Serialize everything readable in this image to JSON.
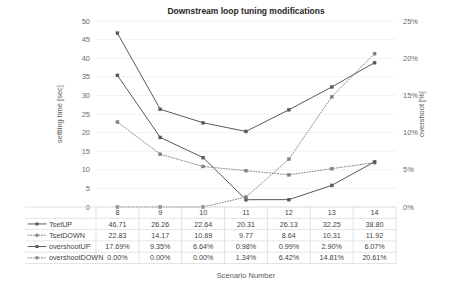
{
  "chart_data": {
    "type": "line",
    "title": "Downstream loop tuning modifications",
    "xlabel": "Scenario Number",
    "ylabel": "settling time [sec]",
    "y2label": "overshoot [%]",
    "categories": [
      "8",
      "9",
      "10",
      "11",
      "12",
      "13",
      "14"
    ],
    "ylim": [
      0,
      50
    ],
    "yticks": [
      "0",
      "5",
      "10",
      "15",
      "20",
      "25",
      "30",
      "35",
      "40",
      "45",
      "50"
    ],
    "y2lim": [
      0,
      25
    ],
    "y2ticks": [
      "0%",
      "5%",
      "10%",
      "15%",
      "20%",
      "25%"
    ],
    "grid": true,
    "legend_position": "bottom-left-table",
    "series": [
      {
        "name": "TsetUP",
        "axis": "left",
        "style": "solid",
        "marker": "square",
        "values": [
          46.71,
          26.26,
          22.64,
          20.31,
          26.13,
          32.25,
          38.8
        ],
        "labels": [
          "46.71",
          "26.26",
          "22.64",
          "20.31",
          "26.13",
          "32.25",
          "38.80"
        ]
      },
      {
        "name": "TsetDOWN",
        "axis": "left",
        "style": "dotted",
        "marker": "square",
        "values": [
          22.83,
          14.17,
          10.89,
          9.77,
          8.64,
          10.31,
          11.92
        ],
        "labels": [
          "22.83",
          "14.17",
          "10.89",
          "9.77",
          "8.64",
          "10.31",
          "11.92"
        ]
      },
      {
        "name": "overshootUP",
        "axis": "right",
        "style": "solid",
        "marker": "square",
        "values": [
          17.69,
          9.35,
          6.64,
          0.98,
          0.99,
          2.9,
          6.07
        ],
        "labels": [
          "17.69%",
          "9.35%",
          "6.64%",
          "0.98%",
          "0.99%",
          "2.90%",
          "6.07%"
        ]
      },
      {
        "name": "overshootDOWN",
        "axis": "right",
        "style": "dotted",
        "marker": "square",
        "values": [
          0.0,
          0.0,
          0.0,
          1.34,
          6.42,
          14.81,
          20.61
        ],
        "labels": [
          "0.00%",
          "0.00%",
          "0.00%",
          "1.34%",
          "6.42%",
          "14.81%",
          "20.61%"
        ]
      }
    ],
    "colors": {
      "line_dark": "#595959",
      "line_mid": "#7f7f7f",
      "grid": "#e8e8e8",
      "text": "#3f3f3f"
    }
  }
}
